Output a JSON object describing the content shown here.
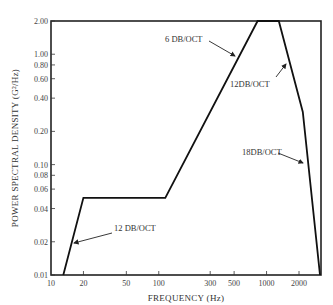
{
  "chart_data": {
    "type": "line",
    "title": "",
    "xlabel": "FREQUENCY (Hz)",
    "ylabel": "POWER SPECTRAL DENSITY (G²/Hz)",
    "xscale": "log",
    "yscale": "log",
    "xlim": [
      10,
      3200
    ],
    "ylim": [
      0.01,
      2.0
    ],
    "grid": false,
    "legend": null,
    "x_ticks": [
      10,
      20,
      50,
      100,
      300,
      500,
      1000,
      2000
    ],
    "x_tick_labels": [
      "10",
      "20",
      "50",
      "100",
      "300",
      "500",
      "1000",
      "2000"
    ],
    "y_ticks": [
      0.01,
      0.02,
      0.04,
      0.06,
      0.08,
      0.1,
      0.2,
      0.4,
      0.6,
      0.8,
      1.0,
      2.0
    ],
    "y_tick_labels": [
      "0.01",
      "0.02",
      "0.04",
      "0.06",
      "0.08",
      "0.10",
      "0.20",
      "0.40",
      "0.60",
      "0.80",
      "1.00",
      "2.00"
    ],
    "series": [
      {
        "name": "PSD profile",
        "x": [
          13,
          20,
          115,
          825,
          1300,
          2170,
          3130
        ],
        "y": [
          0.01,
          0.05,
          0.05,
          2.0,
          2.0,
          0.3,
          0.01
        ]
      }
    ],
    "annotations": [
      {
        "text": "12 DB/OCT",
        "target_segment": "13-20 Hz rise"
      },
      {
        "text": "6 DB/OCT",
        "target_segment": "115-825 Hz rise"
      },
      {
        "text": "12DB/OCT",
        "target_segment": "1300-2170 Hz roll-off"
      },
      {
        "text": "18DB/OCT",
        "target_segment": "2170-3130 Hz roll-off"
      }
    ]
  },
  "labels": {
    "xlabel": "FREQUENCY (Hz)",
    "ylabel": "POWER SPECTRAL DENSITY (G²/Hz)",
    "annot_12_low": "12 DB/OCT",
    "annot_6": "6 DB/OCT",
    "annot_12_high": "12DB/OCT",
    "annot_18": "18DB/OCT"
  }
}
